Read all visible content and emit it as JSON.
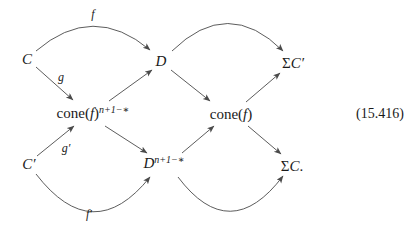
{
  "colors": {
    "background": "#ffffff",
    "text": "#1a1a1a",
    "arrow": "#4a4a4a"
  },
  "equation_number": "(15.416)",
  "nodes": {
    "C": {
      "italic": "C"
    },
    "D": {
      "italic": "D"
    },
    "sigma_C_prime": {
      "roman_prefix": "Σ",
      "italic": "C′"
    },
    "cone_f_dual": {
      "roman_prefix": "cone(",
      "italic": "f",
      "roman_suffix": ")",
      "sup": "n+1−∗"
    },
    "cone_f": {
      "roman_prefix": "cone(",
      "italic": "f",
      "roman_suffix": ")"
    },
    "C_prime": {
      "italic": "C′"
    },
    "D_dual": {
      "italic": "D",
      "sup": "n+1−∗"
    },
    "sigma_C": {
      "roman_prefix": "Σ",
      "italic": "C",
      "post": "."
    }
  },
  "edges": [
    {
      "from": "C",
      "to": "D",
      "label": "f",
      "curved": true
    },
    {
      "from": "C",
      "to": "cone_f_dual",
      "label": "g",
      "curved": false
    },
    {
      "from": "cone_f_dual",
      "to": "D",
      "label": "",
      "curved": false
    },
    {
      "from": "D",
      "to": "cone_f",
      "label": "",
      "curved": false
    },
    {
      "from": "D",
      "to": "sigma_C_prime",
      "label": "",
      "curved": true
    },
    {
      "from": "cone_f",
      "to": "sigma_C_prime",
      "label": "",
      "curved": false
    },
    {
      "from": "C_prime",
      "to": "cone_f_dual",
      "label": "g′",
      "curved": false
    },
    {
      "from": "cone_f_dual",
      "to": "D_dual",
      "label": "",
      "curved": false
    },
    {
      "from": "C_prime",
      "to": "D_dual",
      "label": "f′",
      "curved": true
    },
    {
      "from": "D_dual",
      "to": "cone_f",
      "label": "",
      "curved": false
    },
    {
      "from": "cone_f",
      "to": "sigma_C",
      "label": "",
      "curved": false
    },
    {
      "from": "D_dual",
      "to": "sigma_C",
      "label": "",
      "curved": true
    }
  ]
}
